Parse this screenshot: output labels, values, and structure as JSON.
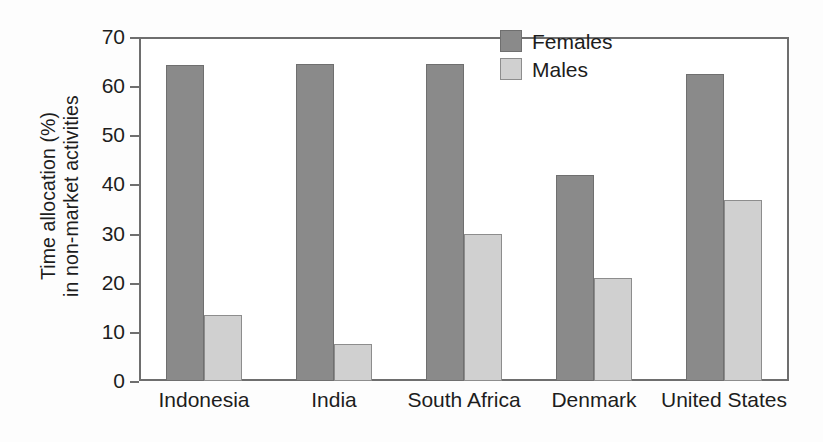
{
  "chart_data": {
    "type": "bar",
    "title": "",
    "xlabel": "",
    "ylabel": "Time allocation (%) in non-market activities",
    "ylabel_line1": "Time allocation (%)",
    "ylabel_line2": "in non-market activities",
    "categories": [
      "Indonesia",
      "India",
      "South Africa",
      "Denmark",
      "United States"
    ],
    "series": [
      {
        "name": "Females",
        "color": "#8a8a8a",
        "values": [
          64.3,
          64.5,
          64.5,
          42.0,
          62.5
        ]
      },
      {
        "name": "Males",
        "color": "#d0d0d0",
        "values": [
          13.5,
          7.5,
          29.9,
          21.0,
          36.8
        ]
      }
    ],
    "ylim": [
      0,
      70
    ],
    "yticks": [
      0,
      10,
      20,
      30,
      40,
      50,
      60,
      70
    ],
    "ytick_labels": [
      "0",
      "10",
      "20",
      "30",
      "40",
      "50",
      "60",
      "70"
    ],
    "grid": false,
    "legend_position": "top-right",
    "legend_entries": [
      "Females",
      "Males"
    ],
    "axis_color": "#6e6e6e",
    "background": "#ffffff"
  }
}
